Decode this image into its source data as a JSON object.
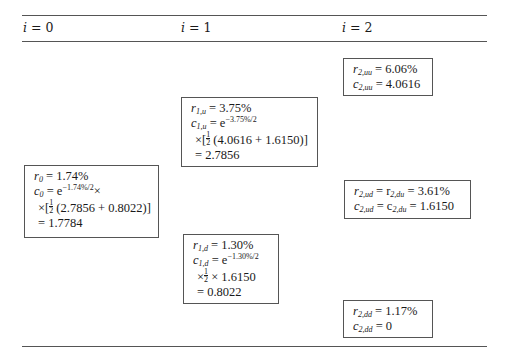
{
  "header": {
    "columns": [
      {
        "var": "i",
        "eq": " = ",
        "value": "0"
      },
      {
        "var": "i",
        "eq": " = ",
        "value": "1"
      },
      {
        "var": "i",
        "eq": " = ",
        "value": "2"
      }
    ]
  },
  "nodes": {
    "n0": {
      "r_label": "r",
      "r_sub": "0",
      "r_value": " = 1.74%",
      "c_label": "c",
      "c_sub": "0",
      "c_eq": " = e",
      "c_exp": "−1.74%/2",
      "c_tail": "×",
      "line3_prefix": "×[",
      "frac_num": "1",
      "frac_den": "2",
      "line3_body": " (2.7856 + 0.8022)]",
      "result": "= 1.7784"
    },
    "n1u": {
      "r_label": "r",
      "r_sub": "1,u",
      "r_value": " = 3.75%",
      "c_label": "c",
      "c_sub": "1,u",
      "c_eq": " = e",
      "c_exp": "−3.75%/2",
      "line3_prefix": "×[",
      "frac_num": "1",
      "frac_den": "2",
      "line3_body": " (4.0616 + 1.6150)]",
      "result": "= 2.7856"
    },
    "n1d": {
      "r_label": "r",
      "r_sub": "1,d",
      "r_value": " = 1.30%",
      "c_label": "c",
      "c_sub": "1,d",
      "c_eq": " = e",
      "c_exp": "−1.30%/2",
      "line3_prefix": "×",
      "frac_num": "1",
      "frac_den": "2",
      "line3_body": " × 1.6150",
      "result": "= 0.8022"
    },
    "n2uu": {
      "r_label": "r",
      "r_sub": "2,uu",
      "r_value": " = 6.06%",
      "c_label": "c",
      "c_sub": "2,uu",
      "c_value": " = 4.0616"
    },
    "n2ud": {
      "r_label": "r",
      "r_sub": "2,ud",
      "r_mid": " = r",
      "r_sub2": "2,du",
      "r_value": " = 3.61%",
      "c_label": "c",
      "c_sub": "2,ud",
      "c_mid": " = c",
      "c_sub2": "2,du",
      "c_value": " = 1.6150"
    },
    "n2dd": {
      "r_label": "r",
      "r_sub": "2,dd",
      "r_value": " = 1.17%",
      "c_label": "c",
      "c_sub": "2,dd",
      "c_value": " = 0"
    }
  }
}
